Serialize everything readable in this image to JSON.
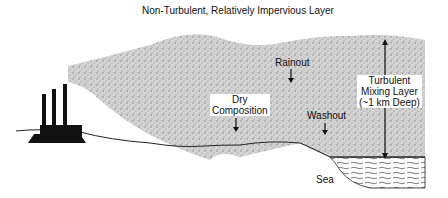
{
  "diagram": {
    "top_label": "Non-Turbulent, Relatively Impervious Layer",
    "labels": {
      "rainout": "Rainout",
      "dry_composition_line1": "Dry",
      "dry_composition_line2": "Composition",
      "washout": "Washout",
      "mixing_line1": "Turbulent",
      "mixing_line2": "Mixing Layer",
      "mixing_line3": "(~1 km Deep)",
      "sea": "Sea"
    },
    "icons": [
      "factory-icon",
      "down-arrow-icon",
      "double-headed-arrow-icon"
    ],
    "colors": {
      "plume": "#9a9a9a",
      "ink": "#111111",
      "background": "#ffffff"
    }
  }
}
